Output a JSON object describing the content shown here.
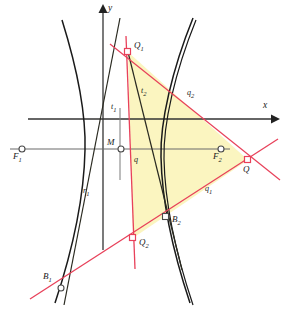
{
  "figure": {
    "width": 285,
    "height": 317,
    "background": "#ffffff"
  },
  "colors": {
    "curve": "#1a1a1a",
    "axis": "#333333",
    "focal_line": "#6b6b6b",
    "red": "#e8415a",
    "tangent": "#2a2a20",
    "fill": "#fbf5c0",
    "fill_stroke": "#c9b96a",
    "marker_stroke": "#4a4a4a",
    "marker_red": "#e8415a",
    "text": "#1a1a1a"
  },
  "axes": {
    "y_label": "y",
    "x_label": "x",
    "y_axis": {
      "x": 103,
      "y_top": 5,
      "y_bottom": 250
    },
    "x_axis": {
      "y": 119,
      "x_left": 28,
      "x_right": 277
    },
    "y_label_pos": {
      "x": 108,
      "y": 6
    },
    "x_label_pos": {
      "x": 262,
      "y": 105
    }
  },
  "focal_line": {
    "y": 149,
    "x_left": 10,
    "x_right": 230
  },
  "points": [
    {
      "id": "Q1",
      "label": "Q",
      "sub": "1",
      "x": 128,
      "y": 52,
      "label_x": 134,
      "label_y": 44,
      "marker": "square",
      "color": "red"
    },
    {
      "id": "Q2",
      "label": "Q",
      "sub": "2",
      "x": 133,
      "y": 238,
      "label_x": 139,
      "label_y": 240,
      "marker": "square",
      "color": "red"
    },
    {
      "id": "Q",
      "label": "Q",
      "sub": "",
      "x": 248,
      "y": 160,
      "label_x": 243,
      "label_y": 166,
      "marker": "square",
      "color": "red"
    },
    {
      "id": "B1",
      "label": "B",
      "sub": "1",
      "x": 60,
      "y": 288,
      "label_x": 44,
      "label_y": 275,
      "marker": "circle",
      "color": "dark"
    },
    {
      "id": "B2",
      "label": "B",
      "sub": "2",
      "x": 166,
      "y": 217,
      "label_x": 172,
      "label_y": 219,
      "marker": "square",
      "color": "dark"
    },
    {
      "id": "M",
      "label": "M",
      "sub": "",
      "x": 121,
      "y": 149,
      "label_x": 108,
      "label_y": 139,
      "marker": "circle",
      "color": "dark"
    },
    {
      "id": "F1",
      "label": "F",
      "sub": "1",
      "x": 22,
      "y": 149,
      "label_x": 14,
      "label_y": 152,
      "marker": "circle",
      "color": "dark"
    },
    {
      "id": "F2",
      "label": "F",
      "sub": "2",
      "x": 221,
      "y": 149,
      "label_x": 214,
      "label_y": 152,
      "marker": "circle",
      "color": "dark"
    }
  ],
  "line_labels": [
    {
      "id": "t1",
      "label": "t",
      "sub": "1",
      "x": 112,
      "y": 106
    },
    {
      "id": "t2",
      "label": "t",
      "sub": "2",
      "x": 142,
      "y": 90
    },
    {
      "id": "q",
      "label": "q",
      "sub": "",
      "x": 134,
      "y": 159
    },
    {
      "id": "q1",
      "label": "q",
      "sub": "1",
      "x": 205,
      "y": 188
    },
    {
      "id": "q2",
      "label": "q",
      "sub": "2",
      "x": 188,
      "y": 92
    },
    {
      "id": "r1",
      "label": "r",
      "sub": "1",
      "x": 84,
      "y": 190
    }
  ],
  "triangle": {
    "name": "Q1-Q2-Q fill",
    "vertices": [
      [
        128,
        52
      ],
      [
        133,
        238
      ],
      [
        248,
        160
      ]
    ],
    "fill": "#fbf5c0"
  },
  "red_lines": [
    {
      "id": "q-vertical",
      "from": [
        126,
        36
      ],
      "to": [
        135,
        269
      ]
    },
    {
      "id": "q2-line",
      "from": [
        110,
        44
      ],
      "to": [
        277,
        177
      ]
    },
    {
      "id": "q1-line",
      "from": [
        32,
        298
      ],
      "to": [
        272,
        143
      ]
    }
  ],
  "tangent_lines": [
    {
      "id": "t1-line",
      "from": [
        119,
        20
      ],
      "to": [
        66,
        297
      ]
    },
    {
      "id": "t2-line",
      "from": [
        128,
        52
      ],
      "to": [
        180,
        265
      ]
    }
  ],
  "hyperbola": {
    "left_branch": "M 62 22 C 76 70 85 115 84 150 C 83 200 72 250 56 300",
    "right_branch": "M 192 20 C 172 70 160 120 161 155 C 162 205 175 255 190 300",
    "right_branch_2": "M 194 22 C 174 72 163 122 164 157 C 165 207 178 257 193 302"
  },
  "gray_tick": {
    "x": 120,
    "y_top": 108,
    "y_bottom": 180
  }
}
